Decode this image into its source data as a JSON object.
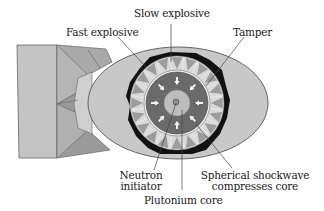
{
  "diagram": {
    "type": "implosion-type nuclear device cross-section",
    "labels": {
      "slow_explosive": "Slow explosive",
      "fast_explosive": "Fast explosive",
      "tamper": "Tamper",
      "neutron_initiator_line1": "Neutron",
      "neutron_initiator_line2": "initiator",
      "shockwave_line1": "Spherical shockwave",
      "shockwave_line2": "compresses core",
      "plutonium_core": "Plutonium core"
    },
    "colors": {
      "casing": "#c8c8c8",
      "casing_outline": "#555555",
      "tail_light": "#c4c4c4",
      "tail_mid": "#a9a9a9",
      "tail_dark": "#9a9a9a",
      "black_layer": "#111111",
      "explosive_light": "#d9d9d9",
      "explosive_wedge": "#9c9c9c",
      "tamper_dark": "#6a6a6a",
      "core": "#bdbdbd",
      "arrow": "#ffffff",
      "leader_line": "#444444"
    },
    "parts": [
      "tail-fins",
      "outer-casing",
      "black-lining",
      "explosive-lens-layer",
      "tamper",
      "plutonium-core",
      "neutron-initiator",
      "inward-shockwave-arrows"
    ]
  }
}
